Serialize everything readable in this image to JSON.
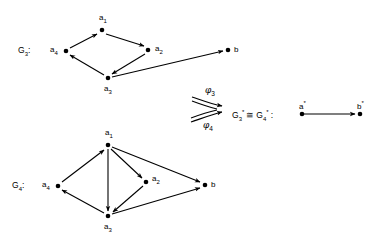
{
  "figure": {
    "type": "diagram",
    "graph_g3": {
      "label": "G",
      "label_sub": "3",
      "label_suffix": ":",
      "nodes": [
        {
          "id": "a1",
          "base": "a",
          "sub": "1",
          "x": 102,
          "y": 30,
          "label_dx": 0,
          "label_dy": -8
        },
        {
          "id": "a2",
          "base": "a",
          "sub": "2",
          "x": 148,
          "y": 50,
          "label_dx": 6,
          "label_dy": 1
        },
        {
          "id": "a3",
          "base": "a",
          "sub": "3",
          "x": 108,
          "y": 78,
          "label_dx": 0,
          "label_dy": 11
        },
        {
          "id": "a4",
          "base": "a",
          "sub": "4",
          "x": 66,
          "y": 51,
          "label_dx": -12,
          "label_dy": 1
        },
        {
          "id": "b",
          "base": "b",
          "sub": "",
          "x": 228,
          "y": 50,
          "label_dx": 6,
          "label_dy": 1
        }
      ],
      "edges": [
        {
          "from": "a4",
          "to": "a1"
        },
        {
          "from": "a1",
          "to": "a2"
        },
        {
          "from": "a2",
          "to": "a3"
        },
        {
          "from": "a3",
          "to": "a4"
        },
        {
          "from": "a3",
          "to": "b"
        }
      ]
    },
    "graph_g4": {
      "label": "G",
      "label_sub": "4",
      "label_suffix": ":",
      "nodes": [
        {
          "id": "a1",
          "base": "a",
          "sub": "1",
          "x": 108,
          "y": 145,
          "label_dx": 0,
          "label_dy": -8
        },
        {
          "id": "a2",
          "base": "a",
          "sub": "2",
          "x": 146,
          "y": 182,
          "label_dx": 6,
          "label_dy": -1
        },
        {
          "id": "a3",
          "base": "a",
          "sub": "3",
          "x": 108,
          "y": 216,
          "label_dx": 0,
          "label_dy": 11
        },
        {
          "id": "a4",
          "base": "a",
          "sub": "4",
          "x": 58,
          "y": 186,
          "label_dx": -12,
          "label_dy": 0
        },
        {
          "id": "b",
          "base": "b",
          "sub": "",
          "x": 205,
          "y": 185,
          "label_dx": 6,
          "label_dy": 1
        }
      ],
      "edges": [
        {
          "from": "a4",
          "to": "a1"
        },
        {
          "from": "a1",
          "to": "a2"
        },
        {
          "from": "a2",
          "to": "a3"
        },
        {
          "from": "a3",
          "to": "a4"
        },
        {
          "from": "a1",
          "to": "a3"
        },
        {
          "from": "a1",
          "to": "b"
        },
        {
          "from": "a3",
          "to": "b"
        }
      ]
    },
    "morphisms": [
      {
        "name": "phi3",
        "base": "φ",
        "sub": "3",
        "x": 209,
        "y": 91
      },
      {
        "name": "phi4",
        "base": "φ",
        "sub": "4",
        "x": 207,
        "y": 124
      }
    ],
    "quotient": {
      "iso_text_g3": "G",
      "iso_text_g3_sub": "3",
      "iso_star_1": "*",
      "iso_symbol": "≅",
      "iso_text_g4": "G",
      "iso_text_g4_sub": "4",
      "iso_star_2": "*",
      "iso_colon": ":",
      "nodes": [
        {
          "id": "astar",
          "base": "a",
          "sup": "*",
          "x": 302,
          "y": 114,
          "label_dx": -2,
          "label_dy": -9
        },
        {
          "id": "bstar",
          "base": "b",
          "sup": "*",
          "x": 360,
          "y": 114,
          "label_dx": -2,
          "label_dy": -9
        }
      ],
      "edges": [
        {
          "from": "astar",
          "to": "bstar"
        }
      ]
    },
    "style": {
      "stroke": "#000000",
      "node_fill": "#000000",
      "node_radius": 2.3,
      "line_width": 1.1,
      "background": "#ffffff"
    }
  }
}
